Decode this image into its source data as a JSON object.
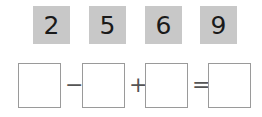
{
  "tiles": [
    {
      "value": "2"
    },
    {
      "value": "5"
    },
    {
      "value": "6"
    },
    {
      "value": "9"
    }
  ],
  "equation": {
    "op1": "−",
    "op2": "+",
    "op3": "=",
    "boxes": [
      "",
      "",
      "",
      ""
    ]
  },
  "colors": {
    "tile_bg": "#c8c8c8",
    "box_border": "#9a9a9a"
  }
}
